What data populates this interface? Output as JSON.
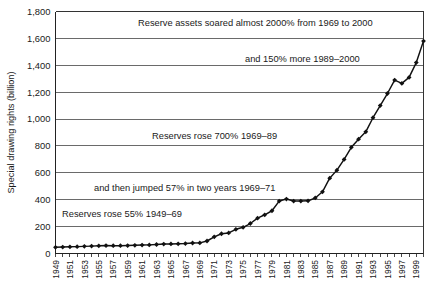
{
  "chart_data": {
    "type": "line",
    "title": "",
    "subtitle": "",
    "xlabel": "",
    "ylabel": "Special drawing rights (billion)",
    "ylim": [
      0,
      1800
    ],
    "xlim": [
      1949,
      2000
    ],
    "grid": true,
    "legend": false,
    "y_ticks": [
      "0",
      "200",
      "400",
      "600",
      "800",
      "1,000",
      "1,200",
      "1,400",
      "1,600",
      "1,800"
    ],
    "y_tick_values": [
      0,
      200,
      400,
      600,
      800,
      1000,
      1200,
      1400,
      1600,
      1800
    ],
    "x_ticks": [
      "1949",
      "1951",
      "1953",
      "1955",
      "1957",
      "1959",
      "1961",
      "1963",
      "1965",
      "1967",
      "1969",
      "1971",
      "1973",
      "1975",
      "1977",
      "1979",
      "1981",
      "1983",
      "1985",
      "1987",
      "1989",
      "1991",
      "1993",
      "1995",
      "1997",
      "1999"
    ],
    "series": [
      {
        "name": "Reserve assets",
        "color": "#111111",
        "x": [
          1949,
          1950,
          1951,
          1952,
          1953,
          1954,
          1955,
          1956,
          1957,
          1958,
          1959,
          1960,
          1961,
          1962,
          1963,
          1964,
          1965,
          1966,
          1967,
          1968,
          1969,
          1970,
          1971,
          1972,
          1973,
          1974,
          1975,
          1976,
          1977,
          1978,
          1979,
          1980,
          1981,
          1982,
          1983,
          1984,
          1985,
          1986,
          1987,
          1988,
          1989,
          1990,
          1991,
          1992,
          1993,
          1994,
          1995,
          1996,
          1997,
          1998,
          1999,
          2000
        ],
        "values": [
          46,
          48,
          50,
          51,
          53,
          55,
          57,
          59,
          58,
          58,
          59,
          61,
          63,
          64,
          67,
          70,
          71,
          72,
          74,
          78,
          79,
          93,
          124,
          147,
          153,
          180,
          195,
          223,
          263,
          288,
          318,
          390,
          405,
          390,
          390,
          392,
          413,
          459,
          560,
          620,
          700,
          790,
          850,
          905,
          1010,
          1100,
          1190,
          1290,
          1265,
          1310,
          1420,
          1580
        ]
      }
    ],
    "annotations": [
      {
        "id": "annot-1",
        "text": "Reserve assets soared almost 2000% from 1969 to 2000",
        "x": 138,
        "y": 26
      },
      {
        "id": "annot-2",
        "text": "and 150% more 1989–2000",
        "x": 245,
        "y": 62
      },
      {
        "id": "annot-3",
        "text": "Reserves rose 700% 1969–89",
        "x": 152,
        "y": 139
      },
      {
        "id": "annot-4",
        "text": "and then jumped 57% in two years 1969–71",
        "x": 94,
        "y": 191
      },
      {
        "id": "annot-5",
        "text": "Reserves rose 55% 1949–69",
        "x": 62,
        "y": 217
      }
    ]
  }
}
